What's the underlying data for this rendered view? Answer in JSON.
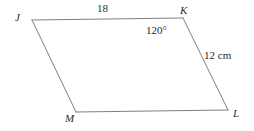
{
  "figure": {
    "type": "parallelogram",
    "stroke_color": "#808080",
    "text_color": "#2b2b2b",
    "background_color": "#ffffff",
    "vertices": [
      {
        "name": "J",
        "label": "J",
        "x": 32,
        "y": 20
      },
      {
        "name": "K",
        "label": "K",
        "x": 183,
        "y": 18
      },
      {
        "name": "L",
        "label": "L",
        "x": 228,
        "y": 110
      },
      {
        "name": "M",
        "label": "M",
        "x": 76,
        "y": 112
      }
    ],
    "edges": [
      {
        "name": "JK",
        "from": "J",
        "to": "K"
      },
      {
        "name": "KL",
        "from": "K",
        "to": "L"
      },
      {
        "name": "LM",
        "from": "L",
        "to": "M"
      },
      {
        "name": "MJ",
        "from": "M",
        "to": "J"
      }
    ],
    "annotations": {
      "top_side_length": "18",
      "right_side_length": "12 cm",
      "angle_at_K": "120°"
    }
  }
}
